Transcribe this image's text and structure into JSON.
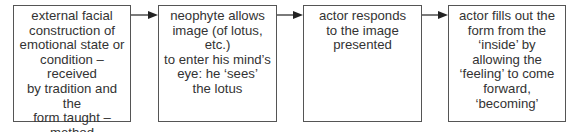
{
  "diagram": {
    "type": "flowchart",
    "direction": "left-to-right",
    "colors": {
      "border": "#555555",
      "text": "#333333",
      "arrow": "#222222",
      "background": "#ffffff"
    },
    "steps": [
      {
        "id": "step-1",
        "text": "external facial\nconstruction of\nemotional state or\ncondition – received\nby tradition and the\nform taught – method\nof teaching: at first\nrepetitive/technical"
      },
      {
        "id": "step-2",
        "text": "neophyte allows\nimage (of lotus, etc.)\nto enter his mind’s\neye: he ‘sees’\nthe lotus"
      },
      {
        "id": "step-3",
        "text": "actor responds\nto the image\npresented"
      },
      {
        "id": "step-4",
        "text": "actor fills out the\nform from the\n‘inside’ by\nallowing the\n‘feeling’ to come\nforward, ‘becoming’"
      }
    ],
    "connectors": [
      {
        "from": "step-1",
        "to": "step-2",
        "icon": "arrow-right-icon"
      },
      {
        "from": "step-2",
        "to": "step-3",
        "icon": "arrow-right-icon"
      },
      {
        "from": "step-3",
        "to": "step-4",
        "icon": "arrow-right-icon"
      }
    ]
  }
}
